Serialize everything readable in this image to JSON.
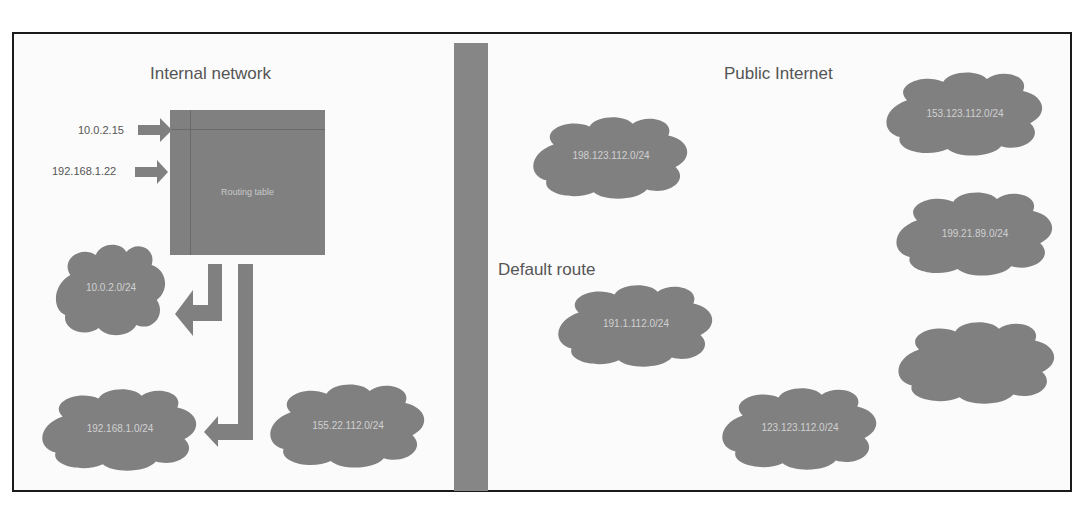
{
  "diagram": {
    "left_section": {
      "title": "Internal network",
      "inputs": [
        {
          "label": "10.0.2.15"
        },
        {
          "label": "192.168.1.22"
        }
      ],
      "routing_table": {
        "label": "Routing table"
      },
      "clouds": [
        {
          "label": "10.0.2.0/24"
        },
        {
          "label": "192.168.1.0/24"
        },
        {
          "label": "155.22.112.0/24"
        }
      ]
    },
    "divider": {
      "label": "Default route"
    },
    "right_section": {
      "title": "Public Internet",
      "clouds": [
        {
          "label": "198.123.112.0/24"
        },
        {
          "label": "153.123.112.0/24"
        },
        {
          "label": "199.21.89.0/24"
        },
        {
          "label": "191.1.112.0/24"
        },
        {
          "label": ""
        },
        {
          "label": "123.123.112.0/24"
        }
      ]
    },
    "colors": {
      "shape_fill": "#808080",
      "frame_border": "#1a1a1a",
      "heading_text": "#555555",
      "shape_text": "#d0d0d0"
    }
  }
}
